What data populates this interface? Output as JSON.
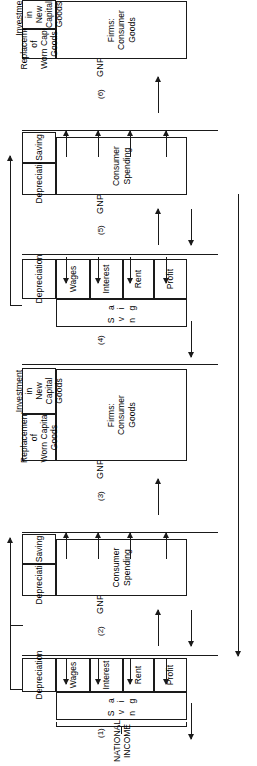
{
  "figure": {
    "national_income_label_line1": "NATIONAL",
    "national_income_label_line2": "INCOME"
  },
  "panels": [
    {
      "number": "(1)",
      "gnp_label": "GNP I",
      "income_boxes": [
        "Wages",
        "Interest",
        "Rent",
        "Profit"
      ],
      "lower_boxes": [
        "Depreciation"
      ],
      "saving_label": "S a v i n g"
    },
    {
      "number": "(2)",
      "gnp_label": "GNP I",
      "income_boxes": [
        "Consumer Spending"
      ],
      "lower_boxes": [
        "Depreciation",
        "Saving"
      ],
      "saving_label": ""
    },
    {
      "number": "(3)",
      "gnp_label": "GNP I",
      "income_boxes": [
        "Firms: Consumer Goods"
      ],
      "lower_boxes": [
        "Replacement of Worn Capital Goods",
        "Investment in New Capital Goods"
      ],
      "saving_label": ""
    },
    {
      "number": "(4)",
      "gnp_label": "GNP II",
      "income_boxes": [
        "Wages",
        "Interest",
        "Rent",
        "Profit"
      ],
      "lower_boxes": [
        "Depreciation"
      ],
      "saving_label": "S a v i n g"
    },
    {
      "number": "(5)",
      "gnp_label": "GNP II",
      "income_boxes": [
        "Consumer Spending"
      ],
      "lower_boxes": [
        "Depreciation",
        "Saving"
      ],
      "saving_label": ""
    },
    {
      "number": "(6)",
      "gnp_label": "GNP II",
      "income_boxes": [
        "Firms: Consumer Goods"
      ],
      "lower_boxes": [
        "Replacement of Worn Capital Goods",
        "Investment in New Capital Goods"
      ],
      "saving_label": ""
    }
  ],
  "box_text": {
    "wages": "Wages",
    "interest": "Interest",
    "rent": "Rent",
    "profit": "Profit",
    "depreciation": "Depreciation",
    "saving": "Saving",
    "consumer_spending": "Consumer\nSpending",
    "firms_consumer_goods": "Firms:\nConsumer\nGoods",
    "replacement": "Replacement of\nWorn Capital Goods",
    "investment": "Investment in\nNew Capital Goods",
    "saving_spaced": "S a v i n g"
  },
  "colors": {
    "ink": "#1a1a1a",
    "paper": "#ffffff"
  }
}
